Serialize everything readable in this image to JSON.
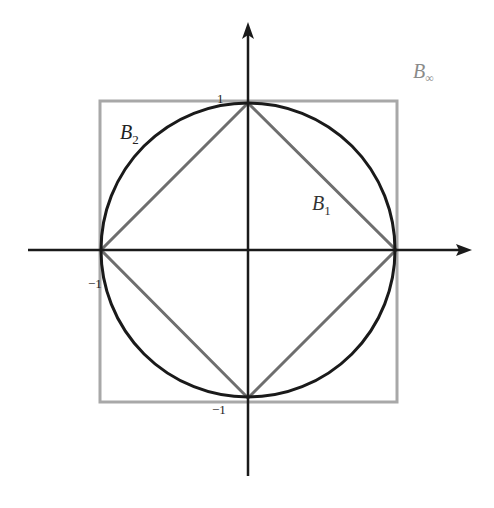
{
  "figure": {
    "labels": {
      "b_inf": {
        "main": "B",
        "sub": "∞"
      },
      "b_2": {
        "main": "B",
        "sub": "2"
      },
      "b_1": {
        "main": "B",
        "sub": "1"
      }
    },
    "ticks": {
      "y_pos": "1",
      "x_neg": "−1",
      "y_neg": "−1"
    },
    "colors": {
      "axis": "#1a1a1a",
      "circle": "#1a1a1a",
      "diamond": "#6e6e6e",
      "square": "#a8a8a8",
      "label_b_inf": "#8a8a8a",
      "label_dark": "#222222"
    }
  },
  "geometry": {
    "center": [
      248,
      250
    ],
    "radius": 147,
    "square": {
      "x": 100,
      "y": 101,
      "w": 297,
      "h": 301
    },
    "x_axis": {
      "from": 28,
      "to": 470
    },
    "y_axis": {
      "from": 476,
      "to": 22
    }
  }
}
